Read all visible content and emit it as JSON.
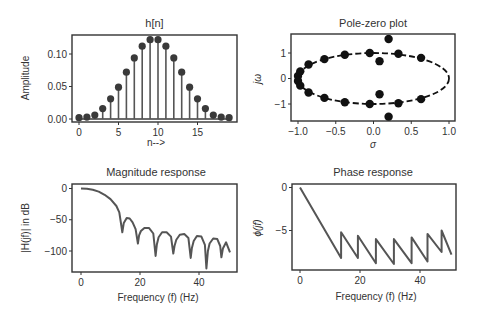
{
  "figure": {
    "colors": {
      "line": "#555555",
      "marker": "#3a3a3a",
      "frame": "#333333",
      "text": "#333333",
      "pz_marker": "#111111"
    }
  },
  "chart_data": [
    {
      "id": "impulse",
      "type": "stem",
      "title": "h[n]",
      "xlabel": "n-->",
      "ylabel": "Amplitude",
      "xlim": [
        -1,
        19.5
      ],
      "ylim": [
        -0.003,
        0.13
      ],
      "xticks": [
        0,
        5,
        10,
        15
      ],
      "xtick_labels": [
        "0",
        "5",
        "10",
        "15"
      ],
      "yticks": [
        0.0,
        0.05,
        0.1
      ],
      "ytick_labels": [
        "0.00",
        "0.05",
        "0.10"
      ],
      "x": [
        0,
        1,
        2,
        3,
        4,
        5,
        6,
        7,
        8,
        9,
        10,
        11,
        12,
        13,
        14,
        15,
        16,
        17,
        18,
        19
      ],
      "values": [
        0.002,
        0.003,
        0.006,
        0.016,
        0.031,
        0.049,
        0.072,
        0.094,
        0.112,
        0.122,
        0.122,
        0.112,
        0.094,
        0.072,
        0.049,
        0.031,
        0.016,
        0.006,
        0.003,
        0.002
      ],
      "grid": false,
      "frame_px": {
        "left": 72,
        "top": 35,
        "right": 237,
        "bottom": 122
      },
      "map_px": {
        "x0": 79,
        "xscale": 7.9,
        "y0": 119,
        "yscale": 650
      }
    },
    {
      "id": "polezero",
      "type": "scatter",
      "title": "Pole-zero plot",
      "xlabel": "σ",
      "ylabel": "jω",
      "xlim": [
        -1.09,
        1.09
      ],
      "ylim": [
        -1.7,
        1.7
      ],
      "xticks": [
        -1.0,
        -0.5,
        0.0,
        0.5,
        1.0
      ],
      "xtick_labels": [
        "−1.0",
        "−0.5",
        "0.0",
        "0.5",
        "1.0"
      ],
      "yticks": [
        1,
        0,
        -1
      ],
      "ytick_labels": [
        "1",
        "0",
        "−1"
      ],
      "ellipse": {
        "cx": 0,
        "cy": 0,
        "rx": 1.0,
        "ry": 1.0,
        "style": "dashed"
      },
      "points": [
        {
          "x": -1.0,
          "y": 0.1
        },
        {
          "x": -1.0,
          "y": -0.1
        },
        {
          "x": -0.97,
          "y": 0.28
        },
        {
          "x": -0.97,
          "y": -0.28
        },
        {
          "x": -0.86,
          "y": 0.55
        },
        {
          "x": -0.86,
          "y": -0.55
        },
        {
          "x": -0.65,
          "y": 0.76
        },
        {
          "x": -0.65,
          "y": -0.76
        },
        {
          "x": -0.38,
          "y": 0.93
        },
        {
          "x": -0.38,
          "y": -0.93
        },
        {
          "x": -0.05,
          "y": 1.0
        },
        {
          "x": -0.05,
          "y": -1.0
        },
        {
          "x": 0.33,
          "y": 0.97
        },
        {
          "x": 0.33,
          "y": -0.97
        },
        {
          "x": 0.63,
          "y": 0.81
        },
        {
          "x": 0.63,
          "y": -0.81
        },
        {
          "x": 0.08,
          "y": 0.68
        },
        {
          "x": 0.08,
          "y": -0.62
        },
        {
          "x": 0.2,
          "y": 1.55
        },
        {
          "x": 0.2,
          "y": -1.5
        }
      ],
      "grid": false,
      "frame_px": {
        "left": 291,
        "top": 34,
        "right": 455,
        "bottom": 121
      },
      "map_px": {
        "x0": 373.5,
        "xscale": 75.5,
        "y0": 78.5,
        "yscale": 25.5
      }
    },
    {
      "id": "magnitude",
      "type": "line",
      "title": "Magnitude response",
      "xlabel": "Frequency (f) (Hz)",
      "ylabel": "|H(jf)| in dB",
      "xlim": [
        -3,
        53
      ],
      "ylim": [
        -135,
        5
      ],
      "xticks": [
        0,
        20,
        40
      ],
      "xtick_labels": [
        "0",
        "20",
        "40"
      ],
      "yticks": [
        0,
        -50,
        -100
      ],
      "ytick_labels": [
        "0",
        "−50",
        "−100"
      ],
      "series": [
        {
          "name": "magnitude_db",
          "x": [
            0,
            2,
            4,
            6,
            8,
            10,
            12,
            13,
            13.7,
            14,
            14.5,
            15.5,
            16.5,
            17.5,
            18.5,
            19.3,
            19.7,
            20.3,
            21.5,
            23,
            24.5,
            25.3,
            25.7,
            26.3,
            27.5,
            29,
            30.5,
            31.3,
            31.7,
            32.3,
            33.5,
            35,
            36.4,
            37.2,
            37.6,
            38.2,
            39.3,
            40.8,
            42,
            42.5,
            43,
            43.6,
            44.8,
            46.2,
            47.2,
            47.6,
            48.1,
            49.2,
            50.5
          ],
          "values": [
            0,
            -0.5,
            -2,
            -5,
            -10,
            -17,
            -28,
            -38,
            -60,
            -70,
            -55,
            -47,
            -48,
            -54,
            -65,
            -88,
            -75,
            -68,
            -63,
            -63,
            -72,
            -108,
            -90,
            -78,
            -70,
            -70,
            -77,
            -104,
            -92,
            -82,
            -74,
            -73,
            -79,
            -111,
            -95,
            -84,
            -76,
            -77,
            -90,
            -128,
            -100,
            -88,
            -80,
            -81,
            -92,
            -110,
            -96,
            -86,
            -102
          ]
        }
      ],
      "grid": false,
      "frame_px": {
        "left": 72,
        "top": 184,
        "right": 237,
        "bottom": 272
      },
      "map_px": {
        "x0": 81,
        "xscale": 2.95,
        "y0": 188.5,
        "yscale": 0.625
      }
    },
    {
      "id": "phase",
      "type": "line",
      "title": "Phase response",
      "xlabel": "Frequency (f) (Hz)",
      "ylabel": "ϕ(jf)",
      "xlim": [
        -3,
        52
      ],
      "ylim": [
        -9.6,
        0.3
      ],
      "xticks": [
        0,
        20,
        40
      ],
      "xtick_labels": [
        "0",
        "20",
        "40"
      ],
      "yticks": [
        0,
        -5
      ],
      "ytick_labels": [
        "0",
        "−5"
      ],
      "series": [
        {
          "name": "phase",
          "x": [
            0,
            13.7,
            13.7,
            19.3,
            19.3,
            25.3,
            25.3,
            31.3,
            31.3,
            37.2,
            37.2,
            42.5,
            42.5,
            47.2,
            47.2,
            50.5
          ],
          "values": [
            0,
            -8.2,
            -5.2,
            -8.2,
            -5.6,
            -8.8,
            -6.0,
            -8.9,
            -6.0,
            -8.8,
            -5.8,
            -8.6,
            -5.4,
            -7.5,
            -5.0,
            -7.8
          ]
        }
      ],
      "grid": false,
      "frame_px": {
        "left": 292,
        "top": 184,
        "right": 456,
        "bottom": 270
      },
      "map_px": {
        "x0": 300,
        "xscale": 3.0,
        "y0": 187.5,
        "yscale": 8.6
      }
    }
  ]
}
